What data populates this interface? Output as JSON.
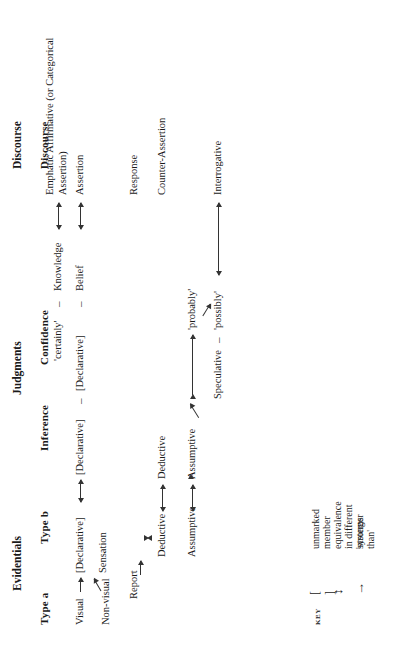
{
  "figure": {
    "groups": {
      "evidentials": "Evidentials",
      "judgments": "Judgments",
      "discourse": "Discourse"
    },
    "columns": {
      "type_a": "Type a",
      "type_b": "Type b",
      "inference": "Inference",
      "confidence": "Confidence",
      "discourse": "Discourse"
    },
    "type_a": {
      "visual": "Visual",
      "non_visual": "Non-visual",
      "report": "Report",
      "deductive": "Deductive",
      "assumptive": "Assumptive"
    },
    "type_b": {
      "declarative": "[Declarative]",
      "sensation": "Sensation",
      "deductive": "Deductive",
      "assumptive": "Assumptive",
      "speculative": "Speculative"
    },
    "inference": {
      "declarative": "[Declarative]"
    },
    "confidence": {
      "certainly": "'certainly'",
      "declarative": "[Declarative]",
      "knowledge": "Knowledge",
      "belief": "Belief",
      "probably": "'probably'",
      "possibly": "'possibly'",
      "dash": "–"
    },
    "discourse": {
      "emphatic": "Emphatic Affirmative\n(or Categorical Assertion)",
      "assertion": "Assertion",
      "response": "Response",
      "counter_assertion": "Counter-Assertion",
      "interrogative": "Interrogative"
    },
    "key": {
      "title": "KEY",
      "symbols": {
        "brackets": "[  ]",
        "double_arrow": "↕",
        "single_arrow": "→"
      },
      "items": [
        "unmarked member",
        "equivalence in different systems",
        "'stronger than'"
      ]
    }
  }
}
